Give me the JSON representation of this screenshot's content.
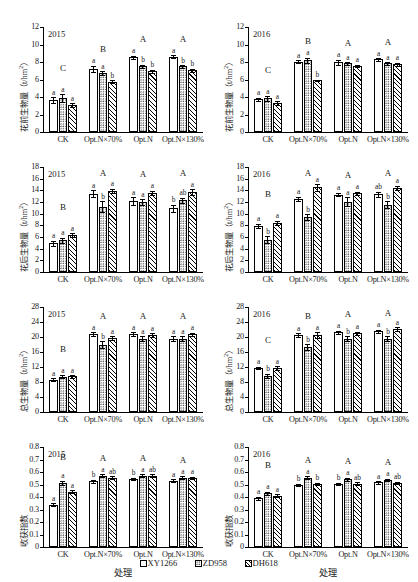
{
  "figure": {
    "xaxis_title": "处理",
    "series": [
      {
        "key": "XY1266",
        "label": "XY1266",
        "fill": "open-white"
      },
      {
        "key": "ZD958",
        "label": "ZD958",
        "fill": "dotted"
      },
      {
        "key": "DH618",
        "label": "DH618",
        "fill": "hatched"
      }
    ],
    "categories": [
      "CK",
      "Opt.N×70%",
      "Opt.N",
      "Opt.N×130%"
    ]
  },
  "chart_data": [
    {
      "type": "bar",
      "panel_id": "pre-anthesis-biomass-2015",
      "title": "2015",
      "ylabel": "花前生物量（t/hm2）",
      "ylabel_unit": "t/hm²",
      "xlabel": "处理",
      "ylim": [
        0,
        12
      ],
      "yticks": [
        0,
        2,
        4,
        6,
        8,
        10,
        12
      ],
      "grid": false,
      "categories": [
        "CK",
        "Opt.N×70%",
        "Opt.N",
        "Opt.N×130%"
      ],
      "group_labels": [
        "C",
        "B",
        "A",
        "A"
      ],
      "series": [
        {
          "name": "XY1266",
          "values": [
            3.65,
            7.25,
            8.55,
            8.6
          ],
          "errors": [
            0.3,
            0.35,
            0.15,
            0.15
          ],
          "letters": [
            "a",
            "a",
            "a",
            "a"
          ]
        },
        {
          "name": "ZD958",
          "values": [
            3.85,
            6.75,
            7.5,
            7.5
          ],
          "errors": [
            0.45,
            0.2,
            0.2,
            0.15
          ],
          "letters": [
            "a",
            "a",
            "b",
            "b"
          ]
        },
        {
          "name": "DH618",
          "values": [
            3.1,
            5.75,
            6.95,
            7.05
          ],
          "errors": [
            0.2,
            0.15,
            0.15,
            0.2
          ],
          "letters": [
            "a",
            "b",
            "b",
            "b"
          ]
        }
      ]
    },
    {
      "type": "bar",
      "panel_id": "pre-anthesis-biomass-2016",
      "title": "2016",
      "ylabel": "花前生物量（t/hm2）",
      "ylabel_unit": "t/hm²",
      "xlabel": "处理",
      "ylim": [
        0,
        12
      ],
      "yticks": [
        0,
        2,
        4,
        6,
        8,
        10,
        12
      ],
      "grid": false,
      "categories": [
        "CK",
        "Opt.N×70%",
        "Opt.N",
        "Opt.N×130%"
      ],
      "group_labels": [
        "C",
        "B",
        "A",
        "A"
      ],
      "series": [
        {
          "name": "XY1266",
          "values": [
            3.75,
            8.05,
            7.95,
            8.3
          ],
          "errors": [
            0.15,
            0.15,
            0.3,
            0.15
          ],
          "letters": [
            "a",
            "a",
            "a",
            "a"
          ]
        },
        {
          "name": "ZD958",
          "values": [
            3.85,
            8.2,
            7.85,
            7.85
          ],
          "errors": [
            0.25,
            0.3,
            0.15,
            0.15
          ],
          "letters": [
            "a",
            "a",
            "a",
            "a"
          ]
        },
        {
          "name": "DH618",
          "values": [
            3.3,
            5.9,
            7.55,
            7.75
          ],
          "errors": [
            0.2,
            0.1,
            0.15,
            0.15
          ],
          "letters": [
            "a",
            "b",
            "a",
            "a"
          ]
        }
      ]
    },
    {
      "type": "bar",
      "panel_id": "post-anthesis-biomass-2015",
      "title": "2015",
      "ylabel": "花后生物量（t/hm2）",
      "ylabel_unit": "t/hm²",
      "xlabel": "处理",
      "ylim": [
        0,
        18
      ],
      "yticks": [
        0,
        2,
        4,
        6,
        8,
        10,
        12,
        14,
        16,
        18
      ],
      "grid": false,
      "categories": [
        "CK",
        "Opt.N×70%",
        "Opt.N",
        "Opt.N×130%"
      ],
      "group_labels": [
        "B",
        "A",
        "A",
        "A"
      ],
      "series": [
        {
          "name": "XY1266",
          "values": [
            4.9,
            13.45,
            12.2,
            10.9
          ],
          "errors": [
            0.45,
            0.55,
            0.65,
            0.6
          ],
          "letters": [
            "a",
            "a",
            "a",
            "b"
          ]
        },
        {
          "name": "ZD958",
          "values": [
            5.45,
            11.2,
            11.95,
            12.3
          ],
          "errors": [
            0.4,
            0.9,
            0.5,
            0.45
          ],
          "letters": [
            "a",
            "b",
            "a",
            "ab"
          ]
        },
        {
          "name": "DH618",
          "values": [
            6.3,
            13.95,
            13.6,
            13.7
          ],
          "errors": [
            0.35,
            0.35,
            0.35,
            0.45
          ],
          "letters": [
            "a",
            "a",
            "a",
            "a"
          ]
        }
      ]
    },
    {
      "type": "bar",
      "panel_id": "post-anthesis-biomass-2016",
      "title": "2016",
      "ylabel": "花后生物量（t/hm2）",
      "ylabel_unit": "t/hm²",
      "xlabel": "处理",
      "ylim": [
        0,
        18
      ],
      "yticks": [
        0,
        2,
        4,
        6,
        8,
        10,
        12,
        14,
        16,
        18
      ],
      "grid": false,
      "categories": [
        "CK",
        "Opt.N×70%",
        "Opt.N",
        "Opt.N×130%"
      ],
      "group_labels": [
        "B",
        "A",
        "A",
        "A"
      ],
      "series": [
        {
          "name": "XY1266",
          "values": [
            7.95,
            12.5,
            13.25,
            13.3
          ],
          "errors": [
            0.35,
            0.4,
            0.3,
            0.45
          ],
          "letters": [
            "a",
            "a",
            "a",
            "ab"
          ]
        },
        {
          "name": "ZD958",
          "values": [
            5.55,
            9.45,
            12.05,
            11.55
          ],
          "errors": [
            0.6,
            0.45,
            0.75,
            0.6
          ],
          "letters": [
            "b",
            "b",
            "a",
            "b"
          ]
        },
        {
          "name": "DH618",
          "values": [
            8.4,
            14.5,
            13.5,
            14.4
          ],
          "errors": [
            0.35,
            0.55,
            0.3,
            0.35
          ],
          "letters": [
            "a",
            "a",
            "a",
            "a"
          ]
        }
      ]
    },
    {
      "type": "bar",
      "panel_id": "total-biomass-2015",
      "title": "2015",
      "ylabel": "总生物量（t/hm2）",
      "ylabel_unit": "t/hm²",
      "xlabel": "处理",
      "ylim": [
        0,
        28
      ],
      "yticks": [
        0,
        4,
        8,
        12,
        16,
        20,
        24,
        28
      ],
      "grid": false,
      "categories": [
        "CK",
        "Opt.N×70%",
        "Opt.N",
        "Opt.N×130%"
      ],
      "group_labels": [
        "B",
        "A",
        "A",
        "A"
      ],
      "series": [
        {
          "name": "XY1266",
          "values": [
            8.6,
            20.75,
            20.8,
            19.6
          ],
          "errors": [
            0.35,
            0.55,
            0.5,
            0.6
          ],
          "letters": [
            "a",
            "a",
            "a",
            "a"
          ]
        },
        {
          "name": "ZD958",
          "values": [
            9.4,
            17.9,
            19.6,
            19.6
          ],
          "errors": [
            0.4,
            0.95,
            0.6,
            0.55
          ],
          "letters": [
            "a",
            "b",
            "a",
            "a"
          ]
        },
        {
          "name": "DH618",
          "values": [
            9.5,
            19.7,
            20.5,
            20.7
          ],
          "errors": [
            0.35,
            0.55,
            0.5,
            0.45
          ],
          "letters": [
            "a",
            "a",
            "a",
            "a"
          ]
        }
      ]
    },
    {
      "type": "bar",
      "panel_id": "total-biomass-2016",
      "title": "2016",
      "ylabel": "总生物量（t/hm2）",
      "ylabel_unit": "t/hm²",
      "xlabel": "处理",
      "ylim": [
        0,
        28
      ],
      "yticks": [
        0,
        4,
        8,
        12,
        16,
        20,
        24,
        28
      ],
      "grid": false,
      "categories": [
        "CK",
        "Opt.N×70%",
        "Opt.N",
        "Opt.N×130%"
      ],
      "group_labels": [
        "C",
        "B",
        "A",
        "A"
      ],
      "series": [
        {
          "name": "XY1266",
          "values": [
            11.7,
            20.5,
            21.3,
            21.5
          ],
          "errors": [
            0.35,
            0.45,
            0.4,
            0.5
          ],
          "letters": [
            "a",
            "a",
            "a",
            "a"
          ]
        },
        {
          "name": "ZD958",
          "values": [
            9.6,
            17.3,
            19.6,
            19.5
          ],
          "errors": [
            0.55,
            0.8,
            0.55,
            0.65
          ],
          "letters": [
            "b",
            "b",
            "b",
            "b"
          ]
        },
        {
          "name": "DH618",
          "values": [
            11.7,
            20.5,
            21.0,
            22.1
          ],
          "errors": [
            0.45,
            0.75,
            0.4,
            0.45
          ],
          "letters": [
            "a",
            "a",
            "a",
            "a"
          ]
        }
      ]
    },
    {
      "type": "bar",
      "panel_id": "harvest-index-2015",
      "title": "2015",
      "ylabel": "收获指数",
      "ylabel_unit": "",
      "xlabel": "处理",
      "ylim": [
        0,
        0.8
      ],
      "yticks": [
        0,
        0.1,
        0.2,
        0.3,
        0.4,
        0.5,
        0.6,
        0.7,
        0.8
      ],
      "grid": false,
      "categories": [
        "CK",
        "Opt.N×70%",
        "Opt.N",
        "Opt.N×130%"
      ],
      "group_labels": [
        "B",
        "A",
        "A",
        "A"
      ],
      "series": [
        {
          "name": "XY1266",
          "values": [
            0.34,
            0.525,
            0.545,
            0.53
          ],
          "errors": [
            0.012,
            0.012,
            0.01,
            0.012
          ],
          "letters": [
            "a",
            "b",
            "b",
            "a"
          ]
        },
        {
          "name": "ZD958",
          "values": [
            0.515,
            0.57,
            0.572,
            0.555
          ],
          "errors": [
            0.015,
            0.012,
            0.012,
            0.012
          ],
          "letters": [
            "a",
            "a",
            "a",
            "a"
          ]
        },
        {
          "name": "DH618",
          "values": [
            0.443,
            0.555,
            0.572,
            0.553
          ],
          "errors": [
            0.012,
            0.012,
            0.01,
            0.01
          ],
          "letters": [
            "a",
            "ab",
            "ab",
            "a"
          ]
        }
      ]
    },
    {
      "type": "bar",
      "panel_id": "harvest-index-2016",
      "title": "2016",
      "ylabel": "收获指数",
      "ylabel_unit": "",
      "xlabel": "处理",
      "ylim": [
        0,
        0.8
      ],
      "yticks": [
        0,
        0.1,
        0.2,
        0.3,
        0.4,
        0.5,
        0.6,
        0.7,
        0.8
      ],
      "grid": false,
      "categories": [
        "CK",
        "Opt.N×70%",
        "Opt.N",
        "Opt.N×130%"
      ],
      "group_labels": [
        "B",
        "A",
        "A",
        "A"
      ],
      "series": [
        {
          "name": "XY1266",
          "values": [
            0.39,
            0.497,
            0.505,
            0.517
          ],
          "errors": [
            0.012,
            0.01,
            0.01,
            0.01
          ],
          "letters": [
            "a",
            "b",
            "b",
            "a"
          ]
        },
        {
          "name": "ZD958",
          "values": [
            0.432,
            0.553,
            0.543,
            0.537
          ],
          "errors": [
            0.012,
            0.012,
            0.012,
            0.01
          ],
          "letters": [
            "a",
            "a",
            "a",
            "a"
          ]
        },
        {
          "name": "DH618",
          "values": [
            0.41,
            0.505,
            0.508,
            0.514
          ],
          "errors": [
            0.012,
            0.01,
            0.012,
            0.01
          ],
          "letters": [
            "a",
            "b",
            "ab",
            "ab"
          ]
        }
      ]
    }
  ]
}
